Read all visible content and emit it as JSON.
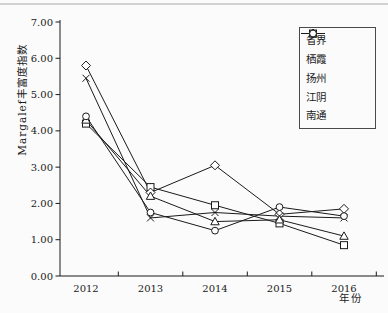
{
  "chart_data": {
    "type": "line",
    "x": [
      "2012",
      "2013",
      "2014",
      "2015",
      "2016"
    ],
    "series": [
      {
        "name": "省界",
        "marker": "square",
        "values": [
          4.2,
          2.45,
          1.95,
          1.45,
          0.85
        ]
      },
      {
        "name": "栖霞",
        "marker": "diamond",
        "values": [
          5.8,
          2.3,
          3.05,
          1.7,
          1.85
        ]
      },
      {
        "name": "扬州",
        "marker": "x",
        "values": [
          5.45,
          1.6,
          1.75,
          1.65,
          1.6
        ]
      },
      {
        "name": "江阴",
        "marker": "triangle",
        "values": [
          4.3,
          2.2,
          1.5,
          1.55,
          1.1
        ]
      },
      {
        "name": "南通",
        "marker": "circle",
        "values": [
          4.4,
          1.75,
          1.25,
          1.9,
          1.65
        ]
      }
    ],
    "title": "",
    "xlabel": "年份",
    "ylabel": "Margalef丰富度指数",
    "ylim": [
      0,
      7
    ],
    "ytick_labels": [
      "0.00",
      "1.00",
      "2.00",
      "3.00",
      "4.00",
      "5.00",
      "6.00",
      "7.00"
    ],
    "grid": false,
    "legend_position": "top-right",
    "colors": {
      "line": "#1a1a1a",
      "marker_fill": "#ffffff",
      "text": "#1a1a1a",
      "frame_rule": "#c4c4c4",
      "background": "#fbfbfb"
    }
  }
}
